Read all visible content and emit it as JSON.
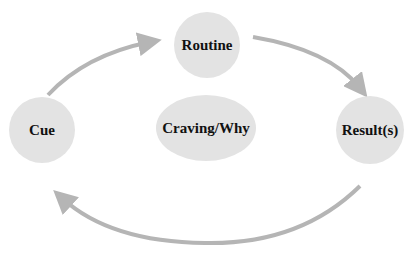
{
  "diagram": {
    "type": "habit-loop",
    "nodes": [
      {
        "id": "routine",
        "label": "Routine"
      },
      {
        "id": "cue",
        "label": "Cue"
      },
      {
        "id": "result",
        "label": "Result(s)"
      },
      {
        "id": "craving",
        "label": "Craving/Why"
      }
    ],
    "edges": [
      {
        "from": "cue",
        "to": "routine"
      },
      {
        "from": "routine",
        "to": "result"
      },
      {
        "from": "result",
        "to": "cue"
      }
    ],
    "colors": {
      "node_fill": "#e3e3e3",
      "arrow": "#b5b5b5",
      "text": "#111111"
    }
  }
}
